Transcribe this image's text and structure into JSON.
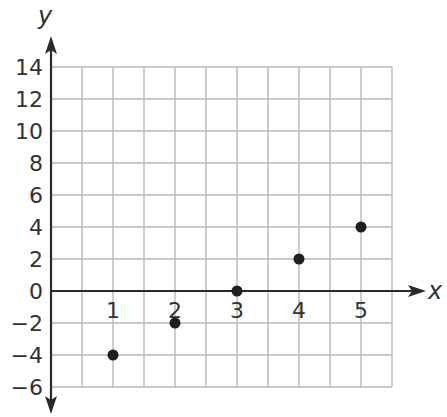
{
  "chart_data": {
    "type": "scatter",
    "title": "",
    "xlabel": "x",
    "ylabel": "y",
    "x": [
      1,
      2,
      3,
      4,
      5
    ],
    "series": [
      {
        "name": "points",
        "x": [
          1,
          2,
          3,
          4,
          5
        ],
        "values": [
          -4,
          -2,
          0,
          2,
          4
        ]
      }
    ],
    "xlim": [
      0,
      5.5
    ],
    "ylim": [
      -6,
      14
    ],
    "x_ticks": [
      1,
      2,
      3,
      4,
      5
    ],
    "y_ticks": [
      14,
      12,
      10,
      8,
      6,
      4,
      2,
      0,
      -2,
      -4,
      -6
    ],
    "x_grid_step": 0.5,
    "y_grid_step": 2,
    "grid": true,
    "legend": null,
    "colors": {
      "grid": "#b8b8b8",
      "axis": "#2a2a2a",
      "point": "#1f1f1f",
      "text": "#333333"
    }
  },
  "labels": {
    "x_axis": "x",
    "y_axis": "y",
    "x_ticks": [
      "1",
      "2",
      "3",
      "4",
      "5"
    ],
    "y_ticks": [
      "14",
      "12",
      "10",
      "8",
      "6",
      "4",
      "2",
      "0",
      "−2",
      "−4",
      "−6"
    ]
  }
}
